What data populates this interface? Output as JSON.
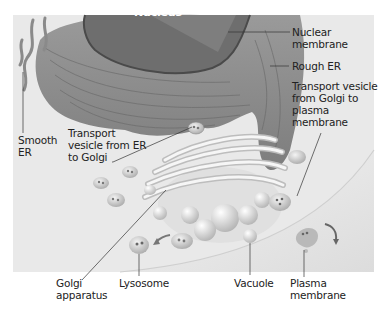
{
  "diagram": {
    "type": "biology-cell-endomembrane-system",
    "colors": {
      "panel": "#e9e9e9",
      "nucleus": "#6e6e6e",
      "er": "#8c8c8c",
      "golgi": "#d8d8d8",
      "vesicle": "#c9c9c9",
      "text": "#222222"
    },
    "labels": {
      "nucleus": "Nucleus",
      "nuclear_membrane": "Nuclear\nmembrane",
      "rough_er": "Rough ER",
      "smooth_er": "Smooth\nER",
      "transport_er_golgi": "Transport\nvesicle from ER\nto Golgi",
      "transport_golgi_plasma": "Transport vesicle\nfrom Golgi to\nplasma\nmembrane",
      "golgi": "Golgi\napparatus",
      "lysosome": "Lysosome",
      "vacuole": "Vacuole",
      "plasma_membrane": "Plasma\nmembrane"
    }
  }
}
